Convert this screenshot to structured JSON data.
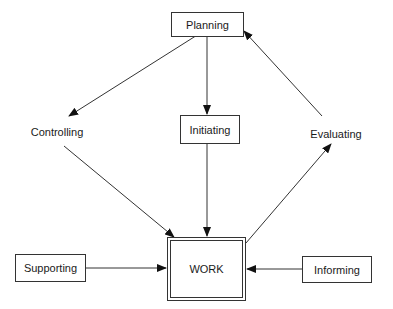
{
  "diagram": {
    "nodes": {
      "planning": "Planning",
      "initiating": "Initiating",
      "work": "WORK",
      "supporting": "Supporting",
      "informing": "Informing",
      "controlling": "Controlling",
      "evaluating": "Evaluating"
    },
    "edges": [
      {
        "from": "Planning",
        "to": "Controlling"
      },
      {
        "from": "Planning",
        "to": "Initiating"
      },
      {
        "from": "Initiating",
        "to": "WORK"
      },
      {
        "from": "Controlling",
        "to": "WORK"
      },
      {
        "from": "WORK",
        "to": "Evaluating"
      },
      {
        "from": "Evaluating",
        "to": "Planning"
      },
      {
        "from": "Supporting",
        "to": "WORK"
      },
      {
        "from": "Informing",
        "to": "WORK"
      }
    ]
  }
}
